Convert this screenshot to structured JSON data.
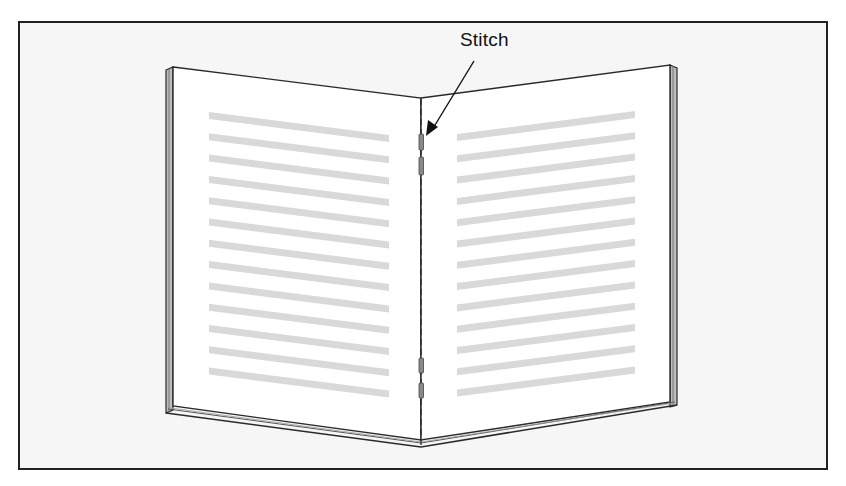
{
  "figure": {
    "label": "Stitch",
    "caption": ""
  },
  "colors": {
    "frame_border": "#222222",
    "frame_bg": "#f6f6f6",
    "page": "#ffffff",
    "text_bar": "#d9d9d9",
    "outline": "#2a2a2a",
    "stitch": "#8a8a8a"
  },
  "book": {
    "left_page": {
      "text_lines": 13
    },
    "right_page": {
      "text_lines": 13
    },
    "stitches": 4
  }
}
